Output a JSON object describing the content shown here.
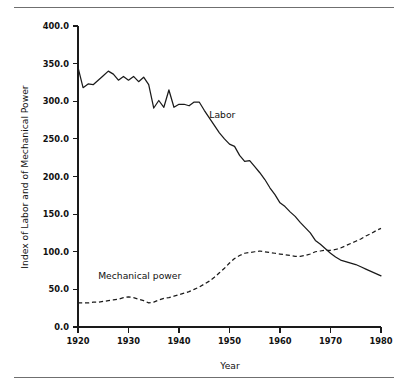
{
  "figure": {
    "top_rule": "horizontal-rule",
    "bottom_rule": "horizontal-rule"
  },
  "chart_data": {
    "type": "line",
    "title": "",
    "xlabel": "Year",
    "ylabel": "Index of Labor and of Mechanical Power",
    "xlim": [
      1920,
      1980
    ],
    "ylim": [
      0.0,
      400.0
    ],
    "grid": false,
    "legend": "inline-annotations",
    "xticks": [
      1920,
      1930,
      1940,
      1950,
      1960,
      1970,
      1980
    ],
    "xtick_labels": [
      "1920",
      "1930",
      "1940",
      "1950",
      "1960",
      "1970",
      "1980"
    ],
    "yticks": [
      0.0,
      50.0,
      100.0,
      150.0,
      200.0,
      250.0,
      300.0,
      350.0,
      400.0
    ],
    "ytick_labels": [
      "0.0",
      "50.0",
      "100.0",
      "150.0",
      "200.0",
      "250.0",
      "300.0",
      "350.0",
      "400.0"
    ],
    "x": [
      1920,
      1921,
      1922,
      1923,
      1924,
      1925,
      1926,
      1927,
      1928,
      1929,
      1930,
      1931,
      1932,
      1933,
      1934,
      1935,
      1936,
      1937,
      1938,
      1939,
      1940,
      1941,
      1942,
      1943,
      1944,
      1945,
      1946,
      1947,
      1948,
      1949,
      1950,
      1951,
      1952,
      1953,
      1954,
      1955,
      1956,
      1957,
      1958,
      1959,
      1960,
      1961,
      1962,
      1963,
      1964,
      1965,
      1966,
      1967,
      1968,
      1969,
      1970,
      1971,
      1972,
      1973,
      1974,
      1975,
      1976,
      1977,
      1978,
      1979,
      1980
    ],
    "series": [
      {
        "name": "Labor",
        "style": "solid",
        "annotation": "Labor",
        "values": [
          345,
          318,
          323,
          322,
          328,
          334,
          340,
          336,
          328,
          333,
          328,
          333,
          326,
          332,
          322,
          291,
          301,
          292,
          315,
          292,
          296,
          296,
          294,
          299,
          299,
          288,
          278,
          268,
          258,
          250,
          243,
          240,
          228,
          220,
          221,
          213,
          205,
          196,
          185,
          176,
          165,
          160,
          153,
          147,
          139,
          132,
          125,
          115,
          110,
          104,
          98,
          93,
          89,
          87,
          85,
          83,
          80,
          77,
          74,
          71,
          68
        ]
      },
      {
        "name": "Mechanical power",
        "style": "dashed",
        "annotation": "Mechanical power",
        "values": [
          32,
          32,
          32,
          33,
          33,
          34,
          35,
          36,
          37,
          39,
          40,
          39,
          37,
          35,
          32,
          33,
          36,
          38,
          39,
          41,
          43,
          45,
          47,
          50,
          53,
          57,
          61,
          66,
          72,
          78,
          85,
          91,
          95,
          98,
          99,
          100,
          101,
          100,
          99,
          98,
          97,
          96,
          95,
          94,
          94,
          95,
          97,
          100,
          101,
          102,
          102,
          103,
          105,
          108,
          111,
          114,
          117,
          121,
          124,
          128,
          131
        ]
      }
    ],
    "annotations": [
      {
        "text": "Labor",
        "x": 1946,
        "y": 278
      },
      {
        "text": "Mechanical power",
        "x": 1924,
        "y": 64
      }
    ]
  }
}
